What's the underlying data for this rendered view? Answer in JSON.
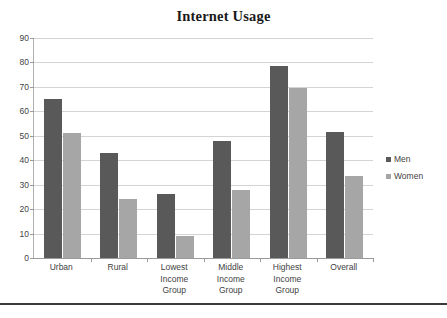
{
  "chart_data": {
    "type": "bar",
    "title": "Internet Usage",
    "xlabel": "",
    "ylabel": "",
    "ylim": [
      0,
      90
    ],
    "ytick_step": 10,
    "yticks": [
      0,
      10,
      20,
      30,
      40,
      50,
      60,
      70,
      80,
      90
    ],
    "grid": true,
    "legend_position": "right",
    "categories": [
      "Urban",
      "Rural",
      "Lowest Income Group",
      "Middle Income Group",
      "Highest Income Group",
      "Overall"
    ],
    "category_lines": [
      [
        "Urban"
      ],
      [
        "Rural"
      ],
      [
        "Lowest",
        "Income",
        "Group"
      ],
      [
        "Middle",
        "Income",
        "Group"
      ],
      [
        "Highest",
        "Income",
        "Group"
      ],
      [
        "Overall"
      ]
    ],
    "series": [
      {
        "name": "Men",
        "color": "#595959",
        "values": [
          65,
          43,
          26,
          48,
          78.5,
          51.5
        ]
      },
      {
        "name": "Women",
        "color": "#a6a6a6",
        "values": [
          51,
          24,
          9,
          28,
          69.5,
          33.5
        ]
      }
    ]
  },
  "legend": {
    "items": [
      {
        "label": "Men",
        "swatch": "men-color-swatch"
      },
      {
        "label": "Women",
        "swatch": "women-color-swatch"
      }
    ]
  },
  "colors": {
    "men": "#595959",
    "women": "#a6a6a6",
    "gridline": "#d4d4d4",
    "axis": "#9a9a9a",
    "text": "#3f3f3f",
    "title": "#1a1a1a",
    "footer_rule": "#3a3a3a"
  }
}
